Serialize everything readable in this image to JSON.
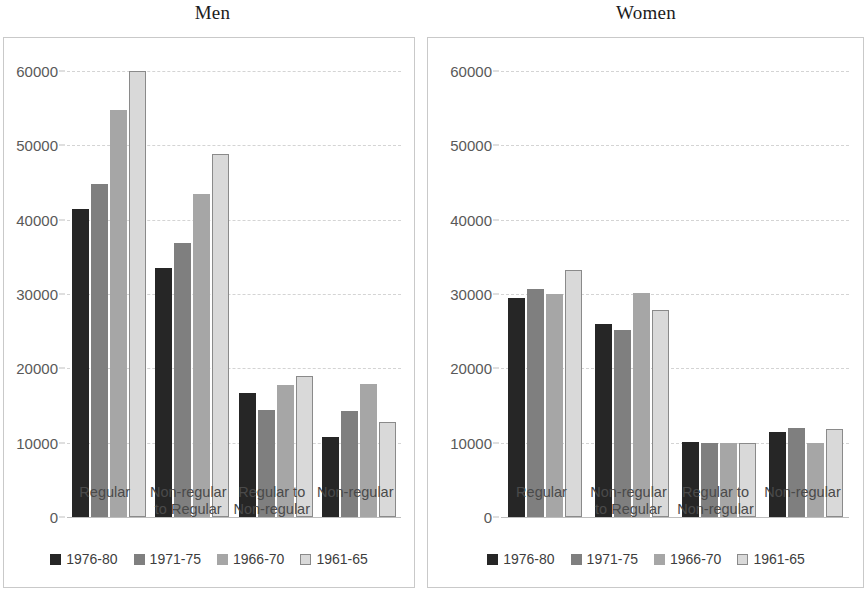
{
  "chart_data": [
    {
      "type": "bar",
      "title": "Men",
      "xlabel": "",
      "ylabel": "",
      "ylim": [
        0,
        60000
      ],
      "yticks": [
        0,
        10000,
        20000,
        30000,
        40000,
        50000,
        60000
      ],
      "ytick_labels": [
        "0",
        "10000",
        "20000",
        "30000",
        "40000",
        "50000",
        "60000"
      ],
      "grid": true,
      "legend_position": "bottom",
      "categories": [
        "Regular",
        "Non-regular\nto Regular",
        "Regular to\nNon-regular",
        "Non-regular"
      ],
      "series": [
        {
          "name": "1976-80",
          "color": "#262626",
          "values": [
            41500,
            33500,
            16700,
            10800
          ]
        },
        {
          "name": "1971-75",
          "color": "#7f7f7f",
          "values": [
            44800,
            36800,
            14400,
            14200
          ]
        },
        {
          "name": "1966-70",
          "color": "#a6a6a6",
          "values": [
            54800,
            43400,
            17800,
            17900
          ]
        },
        {
          "name": "1961-65",
          "color": "#d9d9d9",
          "values": [
            60000,
            48900,
            19000,
            12800
          ]
        }
      ]
    },
    {
      "type": "bar",
      "title": "Women",
      "xlabel": "",
      "ylabel": "",
      "ylim": [
        0,
        60000
      ],
      "yticks": [
        0,
        10000,
        20000,
        30000,
        40000,
        50000,
        60000
      ],
      "ytick_labels": [
        "0",
        "10000",
        "20000",
        "30000",
        "40000",
        "50000",
        "60000"
      ],
      "grid": true,
      "legend_position": "bottom",
      "categories": [
        "Regular",
        "Non-regular\nto Regular",
        "Regular to\nNon-regular",
        "Non-regular"
      ],
      "series": [
        {
          "name": "1976-80",
          "color": "#262626",
          "values": [
            29500,
            26000,
            10100,
            11500
          ]
        },
        {
          "name": "1971-75",
          "color": "#7f7f7f",
          "values": [
            30700,
            25100,
            10000,
            12000
          ]
        },
        {
          "name": "1966-70",
          "color": "#a6a6a6",
          "values": [
            30000,
            30100,
            9900,
            10000
          ]
        },
        {
          "name": "1961-65",
          "color": "#d9d9d9",
          "values": [
            33200,
            27800,
            9900,
            11800
          ]
        }
      ]
    }
  ],
  "panels": [
    {
      "id": "men",
      "title": "Men",
      "ytick_labels": [
        "60000",
        "50000",
        "40000",
        "30000",
        "20000",
        "10000",
        "0"
      ],
      "categories": [
        "Regular",
        "Non-regular\nto Regular",
        "Regular to\nNon-regular",
        "Non-regular"
      ],
      "legend": [
        {
          "label": "1976-80"
        },
        {
          "label": "1971-75"
        },
        {
          "label": "1966-70"
        },
        {
          "label": "1961-65"
        }
      ]
    },
    {
      "id": "women",
      "title": "Women",
      "ytick_labels": [
        "60000",
        "50000",
        "40000",
        "30000",
        "20000",
        "10000",
        "0"
      ],
      "categories": [
        "Regular",
        "Non-regular\nto Regular",
        "Regular to\nNon-regular",
        "Non-regular"
      ],
      "legend": [
        {
          "label": "1976-80"
        },
        {
          "label": "1971-75"
        },
        {
          "label": "1966-70"
        },
        {
          "label": "1961-65"
        }
      ]
    }
  ]
}
